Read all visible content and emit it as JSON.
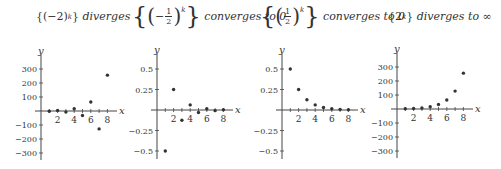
{
  "panels": [
    {
      "title_expr": "{(−2)",
      "title_exp": "k",
      "title_close": "}",
      "title_text": "diverges"
    },
    {
      "title_text": "converges to 0",
      "frac_num": "1",
      "frac_den": "2",
      "sign": "−",
      "exp": "k"
    },
    {
      "title_text": "converges to 0",
      "frac_num": "1",
      "frac_den": "2",
      "exp": "k"
    },
    {
      "title_expr": "{2",
      "title_exp": "k",
      "title_close": "}",
      "title_text": "diverges to ∞"
    }
  ],
  "chart_data": [
    {
      "type": "scatter",
      "title": "{(-2)^k} diverges",
      "xlabel": "x",
      "ylabel": "y",
      "x": [
        1,
        2,
        3,
        4,
        5,
        6,
        7,
        8
      ],
      "values": [
        -2,
        4,
        -8,
        16,
        -32,
        64,
        -128,
        256
      ],
      "xticks": [
        2,
        4,
        6,
        8
      ],
      "yticks": [
        300,
        200,
        100,
        -100,
        -200,
        -300
      ],
      "ylim": [
        -350,
        350
      ],
      "xlim": [
        0,
        9
      ],
      "grid": false
    },
    {
      "type": "scatter",
      "title": "{(-1/2)^k} converges to 0",
      "xlabel": "x",
      "ylabel": "y",
      "x": [
        1,
        2,
        3,
        4,
        5,
        6,
        7,
        8
      ],
      "values": [
        -0.5,
        0.25,
        -0.125,
        0.0625,
        -0.03125,
        0.015625,
        -0.0078125,
        0.00390625
      ],
      "xticks": [
        2,
        4,
        6,
        8
      ],
      "yticks": [
        0.5,
        0.25,
        -0.25,
        -0.5
      ],
      "ylim": [
        -0.6,
        0.6
      ],
      "xlim": [
        0,
        9
      ],
      "grid": false
    },
    {
      "type": "scatter",
      "title": "{(1/2)^k} converges to 0",
      "xlabel": "x",
      "ylabel": "y",
      "x": [
        1,
        2,
        3,
        4,
        5,
        6,
        7,
        8
      ],
      "values": [
        0.5,
        0.25,
        0.125,
        0.0625,
        0.03125,
        0.015625,
        0.0078125,
        0.00390625
      ],
      "xticks": [
        2,
        4,
        6,
        8
      ],
      "yticks": [
        0.5,
        0.25,
        -0.25,
        -0.5
      ],
      "ylim": [
        -0.6,
        0.6
      ],
      "xlim": [
        0,
        9
      ],
      "grid": false
    },
    {
      "type": "scatter",
      "title": "{2^k} diverges to ∞",
      "xlabel": "x",
      "ylabel": "y",
      "x": [
        1,
        2,
        3,
        4,
        5,
        6,
        7,
        8
      ],
      "values": [
        2,
        4,
        8,
        16,
        32,
        64,
        128,
        256
      ],
      "xticks": [
        2,
        4,
        6,
        8
      ],
      "yticks": [
        300,
        200,
        100,
        -100,
        -200,
        -300
      ],
      "ylim": [
        -350,
        350
      ],
      "xlim": [
        0,
        9
      ],
      "grid": false
    }
  ]
}
